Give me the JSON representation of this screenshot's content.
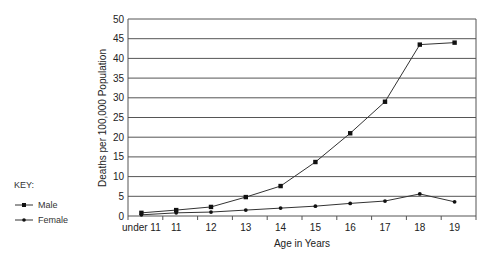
{
  "chart_data": {
    "type": "line",
    "title": "",
    "xlabel": "Age in Years",
    "ylabel": "Deaths per 100,000 Population",
    "categories": [
      "under 11",
      "11",
      "12",
      "13",
      "14",
      "15",
      "16",
      "17",
      "18",
      "19"
    ],
    "series": [
      {
        "name": "Male",
        "marker": "square",
        "values": [
          0.8,
          1.5,
          2.3,
          4.8,
          7.6,
          13.7,
          21.0,
          29.0,
          43.5,
          44.0
        ]
      },
      {
        "name": "Female",
        "marker": "dot",
        "values": [
          0.3,
          0.8,
          1.0,
          1.5,
          2.0,
          2.5,
          3.2,
          3.8,
          5.6,
          3.6
        ]
      }
    ],
    "ylim": [
      0,
      50
    ],
    "yticks": [
      0,
      5,
      10,
      15,
      20,
      25,
      30,
      35,
      40,
      45,
      50
    ],
    "grid": "horizontal",
    "legend_position": "left",
    "legend_title": "KEY:"
  },
  "legend": {
    "title": "KEY:",
    "items": [
      {
        "label": "Male"
      },
      {
        "label": "Female"
      }
    ]
  },
  "colors": {
    "line": "#333333",
    "grid": "#555555"
  }
}
